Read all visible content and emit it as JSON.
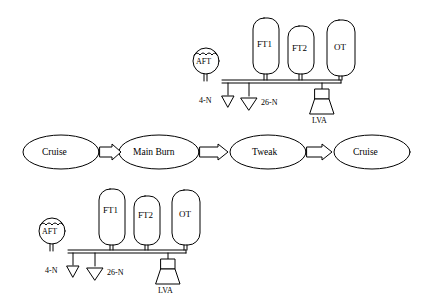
{
  "diagram": {
    "title": "",
    "states": [
      {
        "id": "state-cruise-1",
        "label": "Cruise",
        "cx": 61,
        "cy": 152,
        "rx": 38,
        "ry": 17
      },
      {
        "id": "state-main-burn",
        "label": "Main Burn",
        "cx": 159,
        "cy": 152,
        "rx": 40,
        "ry": 17
      },
      {
        "id": "state-tweak",
        "label": "Tweak",
        "cx": 268,
        "cy": 152,
        "rx": 38,
        "ry": 17
      },
      {
        "id": "state-cruise-2",
        "label": "Cruise",
        "cx": 372,
        "cy": 152,
        "rx": 38,
        "ry": 17
      }
    ],
    "transitions": [
      {
        "from": "state-cruise-1",
        "to": "state-main-burn"
      },
      {
        "from": "state-main-burn",
        "to": "state-tweak"
      },
      {
        "from": "state-tweak",
        "to": "state-cruise-2"
      }
    ],
    "top_schematic": {
      "tanks": [
        {
          "label": "FT1",
          "x": 253,
          "y": 18,
          "w": 26,
          "h": 56
        },
        {
          "label": "FT2",
          "x": 288,
          "y": 26,
          "w": 26,
          "h": 48
        },
        {
          "label": "OT",
          "x": 327,
          "y": 20,
          "w": 28,
          "h": 56
        }
      ],
      "aft_label": "AFT",
      "thruster_left_label": "4-N",
      "thruster_right_label": "26-N",
      "engine_label": "LVA"
    },
    "bottom_schematic": {
      "tanks": [
        {
          "label": "FT1",
          "x": 99,
          "y": 189,
          "w": 26,
          "h": 56
        },
        {
          "label": "FT2",
          "x": 134,
          "y": 196,
          "w": 26,
          "h": 49
        },
        {
          "label": "OT",
          "x": 172,
          "y": 190,
          "w": 28,
          "h": 55
        }
      ],
      "aft_label": "AFT",
      "thruster_left_label": "4-N",
      "thruster_right_label": "26-N",
      "engine_label": "LVA"
    },
    "colors": {
      "stroke": "#000000",
      "fill": "#ffffff",
      "text": "#000000"
    }
  }
}
